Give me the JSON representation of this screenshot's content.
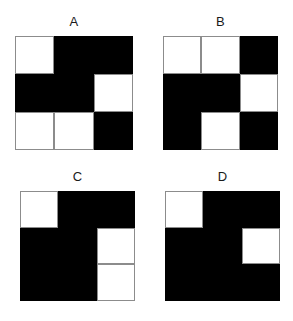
{
  "figure": {
    "background_color": "#ffffff",
    "cell_black_color": "#000000",
    "cell_white_color": "#ffffff",
    "cell_border_color": "#8c8c8c",
    "label_color": "#1a1a1a"
  },
  "panels": [
    {
      "label": "A",
      "rows": 3,
      "cols": 3,
      "cells": [
        [
          "white",
          "black",
          "black"
        ],
        [
          "black",
          "black",
          "white"
        ],
        [
          "white",
          "white",
          "black"
        ]
      ]
    },
    {
      "label": "B",
      "rows": 3,
      "cols": 3,
      "cells": [
        [
          "white",
          "white",
          "black"
        ],
        [
          "black",
          "black",
          "white"
        ],
        [
          "black",
          "white",
          "black"
        ]
      ]
    },
    {
      "label": "C",
      "rows": 3,
      "cols": 3,
      "cells": [
        [
          "white",
          "black",
          "black"
        ],
        [
          "black",
          "black",
          "white"
        ],
        [
          "black",
          "black",
          "white"
        ]
      ]
    },
    {
      "label": "D",
      "rows": 3,
      "cols": 3,
      "cells": [
        [
          "white",
          "black",
          "black"
        ],
        [
          "black",
          "black",
          "white"
        ],
        [
          "black",
          "black",
          "black"
        ]
      ]
    }
  ]
}
